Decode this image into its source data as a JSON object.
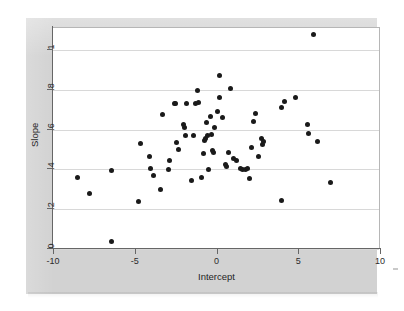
{
  "figure": {
    "background_color": "#d2d2d2",
    "plot_background_color": "#ffffff",
    "point_color": "#1a1a1a",
    "gridline_color": "#d8d8d8",
    "axis_color": "#666666"
  },
  "chart_data": {
    "type": "scatter",
    "title": "",
    "xlabel": "Intercept",
    "ylabel": "Slope",
    "xlim": [
      -10,
      10
    ],
    "ylim": [
      0,
      1.12
    ],
    "xticks": [
      -10,
      -5,
      0,
      5,
      10
    ],
    "xticklabels": [
      "-10",
      "-5",
      "0",
      "5",
      "10"
    ],
    "yticks": [
      0,
      0.2,
      0.4,
      0.6,
      0.8,
      1
    ],
    "yticklabels": [
      "0",
      ".2",
      ".4",
      ".6",
      ".8",
      "1"
    ],
    "grid": "horizontal",
    "legend": "none",
    "marker": "filled-circle",
    "n_points": 74,
    "points": [
      [
        -8.5,
        0.362
      ],
      [
        -7.8,
        0.281
      ],
      [
        -6.4,
        0.396
      ],
      [
        -6.4,
        0.038
      ],
      [
        -4.8,
        0.24
      ],
      [
        -4.65,
        0.528
      ],
      [
        -4.1,
        0.463
      ],
      [
        -4.05,
        0.405
      ],
      [
        -3.85,
        0.372
      ],
      [
        -3.45,
        0.297
      ],
      [
        -3.3,
        0.675
      ],
      [
        -2.95,
        0.402
      ],
      [
        -2.85,
        0.443
      ],
      [
        -2.6,
        0.731
      ],
      [
        -2.5,
        0.733
      ],
      [
        -2.45,
        0.537
      ],
      [
        -2.3,
        0.5
      ],
      [
        -2.0,
        0.626
      ],
      [
        -1.95,
        0.609
      ],
      [
        -1.9,
        0.572
      ],
      [
        -1.85,
        0.733
      ],
      [
        -1.55,
        0.343
      ],
      [
        -1.4,
        0.571
      ],
      [
        -1.3,
        0.733
      ],
      [
        -1.15,
        0.796
      ],
      [
        -1.1,
        0.735
      ],
      [
        -0.95,
        0.362
      ],
      [
        -0.8,
        0.478
      ],
      [
        -0.75,
        0.546
      ],
      [
        -0.7,
        0.555
      ],
      [
        -0.6,
        0.637
      ],
      [
        -0.55,
        0.571
      ],
      [
        -0.5,
        0.401
      ],
      [
        -0.35,
        0.668
      ],
      [
        -0.3,
        0.575
      ],
      [
        -0.25,
        0.497
      ],
      [
        -0.2,
        0.487
      ],
      [
        -0.1,
        0.61
      ],
      [
        0.05,
        0.69
      ],
      [
        0.15,
        0.76
      ],
      [
        0.2,
        0.872
      ],
      [
        0.35,
        0.663
      ],
      [
        0.55,
        0.423
      ],
      [
        0.6,
        0.415
      ],
      [
        0.75,
        0.487
      ],
      [
        0.85,
        0.808
      ],
      [
        1.05,
        0.455
      ],
      [
        1.25,
        0.444
      ],
      [
        1.45,
        0.403
      ],
      [
        1.6,
        0.4
      ],
      [
        1.75,
        0.4
      ],
      [
        1.9,
        0.403
      ],
      [
        2.0,
        0.356
      ],
      [
        2.15,
        0.508
      ],
      [
        2.25,
        0.64
      ],
      [
        2.4,
        0.681
      ],
      [
        2.55,
        0.463
      ],
      [
        2.75,
        0.556
      ],
      [
        2.8,
        0.524
      ],
      [
        2.85,
        0.54
      ],
      [
        3.95,
        0.245
      ],
      [
        4.0,
        0.712
      ],
      [
        4.15,
        0.743
      ],
      [
        4.85,
        0.761
      ],
      [
        5.55,
        0.624
      ],
      [
        5.65,
        0.583
      ],
      [
        5.95,
        1.078
      ],
      [
        6.15,
        0.54
      ],
      [
        7.0,
        0.335
      ]
    ]
  }
}
